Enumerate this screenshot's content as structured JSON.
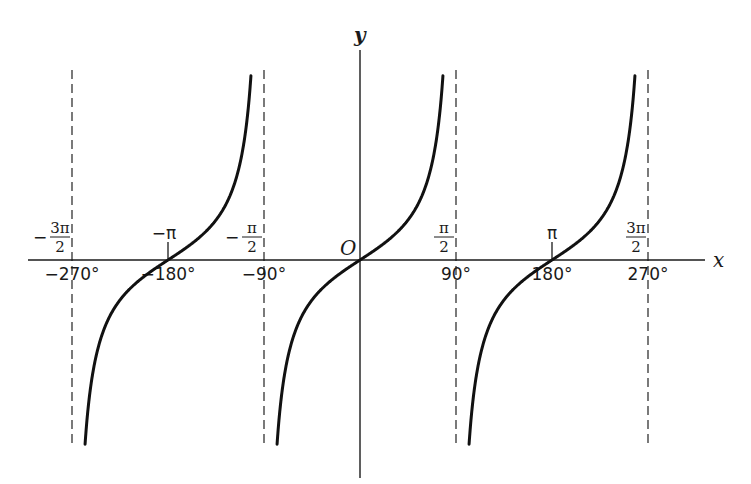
{
  "chart_data": {
    "type": "line",
    "title": "",
    "function": "y = tan(x)",
    "xlabel": "x",
    "ylabel": "y",
    "origin_label": "O",
    "xlim_degrees": [
      -300,
      300
    ],
    "ylim": [
      -5,
      5
    ],
    "grid": false,
    "legend": "none",
    "x_ticks": [
      {
        "deg": -270,
        "degree_label": "−270°",
        "radian_label": {
          "sign": "−",
          "num": "3π",
          "den": "2"
        },
        "asymptote": true
      },
      {
        "deg": -180,
        "degree_label": "−180°",
        "radian_label": {
          "sign": "−",
          "plain": "π"
        },
        "asymptote": false
      },
      {
        "deg": -90,
        "degree_label": "−90°",
        "radian_label": {
          "sign": "−",
          "num": "π",
          "den": "2"
        },
        "asymptote": true
      },
      {
        "deg": 90,
        "degree_label": "90°",
        "radian_label": {
          "sign": "",
          "num": "π",
          "den": "2"
        },
        "asymptote": true
      },
      {
        "deg": 180,
        "degree_label": "180°",
        "radian_label": {
          "sign": "",
          "plain": "π"
        },
        "asymptote": false
      },
      {
        "deg": 270,
        "degree_label": "270°",
        "radian_label": {
          "sign": "",
          "num": "3π",
          "den": "2"
        },
        "asymptote": true
      }
    ],
    "series": [
      {
        "name": "tan branch (-270°, -90°)",
        "domain_deg": [
          -270,
          -90
        ],
        "zero_at_deg": -180
      },
      {
        "name": "tan branch (-90°, 90°)",
        "domain_deg": [
          -90,
          90
        ],
        "zero_at_deg": 0
      },
      {
        "name": "tan branch (90°, 270°)",
        "domain_deg": [
          90,
          270
        ],
        "zero_at_deg": 180
      }
    ]
  }
}
